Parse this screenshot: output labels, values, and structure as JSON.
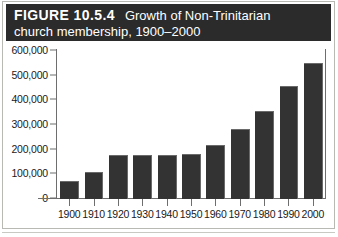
{
  "caption": {
    "figure_number": "FIGURE 10.5.4",
    "title": "Growth of Non-Trinitarian",
    "title_line2": "church membership, 1900–2000"
  },
  "colors": {
    "caption_band": "#2b2b2b",
    "caption_text": "#ffffff",
    "bar_fill": "#333333",
    "axis": "#6e6e6e",
    "page_background": "#ffffff"
  },
  "chart_data": {
    "type": "bar",
    "title": "Growth of Non-Trinitarian church membership, 1900–2000",
    "xlabel": "",
    "ylabel": "",
    "categories": [
      "1900",
      "1910",
      "1920",
      "1930",
      "1940",
      "1950",
      "1960",
      "1970",
      "1980",
      "1990",
      "2000"
    ],
    "values": [
      69000,
      106000,
      175000,
      176000,
      175000,
      180000,
      216000,
      278000,
      351000,
      453000,
      548000
    ],
    "ylim": [
      0,
      600000
    ],
    "ytick_values": [
      0,
      100000,
      200000,
      300000,
      400000,
      500000,
      600000
    ],
    "ytick_labels": [
      "0",
      "100,000",
      "200,000",
      "300,000",
      "400,000",
      "500,000",
      "600,000"
    ],
    "grid": false,
    "legend": null
  }
}
